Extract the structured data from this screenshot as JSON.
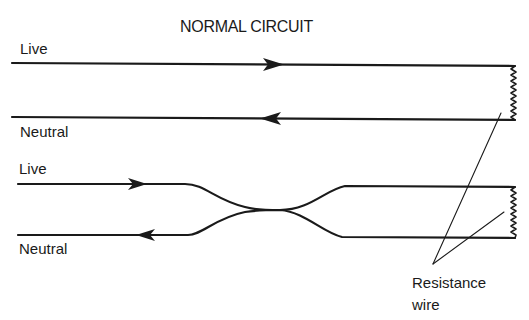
{
  "title": "NORMAL CIRCUIT",
  "colors": {
    "line": "#1a1a1a",
    "background": "#ffffff"
  },
  "top_circuit": {
    "live_label": "Live",
    "neutral_label": "Neutral",
    "live_arrow_direction": "right",
    "neutral_arrow_direction": "left"
  },
  "bottom_circuit": {
    "live_label": "Live",
    "neutral_label": "Neutral",
    "live_arrow_direction": "right",
    "neutral_arrow_direction": "left",
    "wires_pinched_together": true
  },
  "annotation": {
    "line1": "Resistance",
    "line2": "wire"
  }
}
